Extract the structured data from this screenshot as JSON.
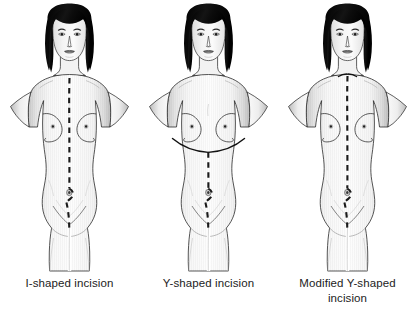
{
  "illustration": {
    "title": "Autopsy incision types",
    "background_color": "#ffffff",
    "line_color": "#1a1a1a",
    "hair_color": "#111111",
    "skin_color": "#f6f6f6",
    "shadow_color": "#cfcfcf",
    "caption_color": "#1c1c1c"
  },
  "figures": [
    {
      "id": "i-shaped",
      "caption_lines": [
        "I-shaped incision"
      ],
      "incision": {
        "type": "I",
        "description": "single vertical midline dashed incision from sternal notch to pubis, deviating around the umbilicus",
        "dashed": true,
        "solid_segments": 0
      }
    },
    {
      "id": "y-shaped",
      "caption_lines": [
        "Y-shaped incision"
      ],
      "incision": {
        "type": "Y",
        "description": "solid curved incision from each shoulder running beneath the breasts meeting at the xiphoid, then dashed vertical midline to pubis",
        "dashed": true,
        "solid_segments": 2
      }
    },
    {
      "id": "modified-y-shaped",
      "caption_lines": [
        "Modified Y-shaped",
        "incision"
      ],
      "incision": {
        "type": "Modified Y",
        "description": "short solid curve across the base of the neck joining a dashed vertical midline incision to the pubis",
        "dashed": true,
        "solid_segments": 1
      }
    }
  ]
}
